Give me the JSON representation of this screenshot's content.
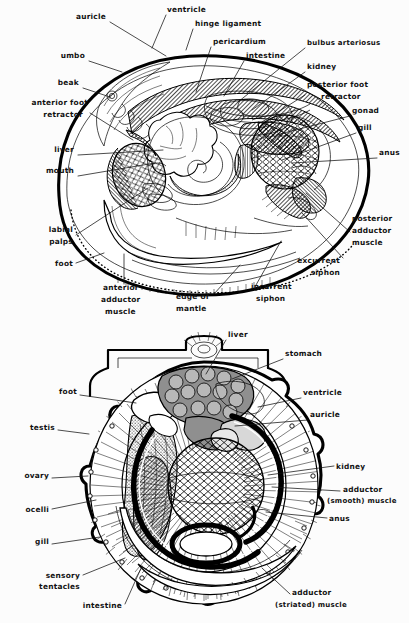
{
  "page": {
    "background": "#fcfcfc",
    "ink": "#111111",
    "width": 409,
    "height": 623
  },
  "figures": [
    {
      "id": "clam",
      "name": "freshwater-mussel-internal-anatomy",
      "labels": [
        {
          "text": "auricle",
          "x": 106,
          "y": 19,
          "anchor": "end",
          "leader": [
            [
              110,
              22
            ],
            [
              166,
              56
            ]
          ]
        },
        {
          "text": "ventricle",
          "x": 167,
          "y": 12,
          "anchor": "start",
          "leader": [
            [
              166,
              15
            ],
            [
              152,
              48
            ]
          ]
        },
        {
          "text": "hinge ligament",
          "x": 195,
          "y": 26,
          "anchor": "start",
          "leader": [
            [
              193,
              29
            ],
            [
              186,
              50
            ]
          ]
        },
        {
          "text": "pericardium",
          "x": 213,
          "y": 44,
          "anchor": "start",
          "leader": [
            [
              211,
              47
            ],
            [
              196,
              92
            ]
          ]
        },
        {
          "text": "intestine",
          "x": 246,
          "y": 58,
          "anchor": "start",
          "leader": [
            [
              244,
              61
            ],
            [
              224,
              96
            ]
          ]
        },
        {
          "text": "bulbus arteriosus",
          "x": 307,
          "y": 45,
          "anchor": "start",
          "leader": [
            [
              305,
              48
            ],
            [
              238,
              102
            ]
          ]
        },
        {
          "text": "kidney",
          "x": 307,
          "y": 69,
          "anchor": "start",
          "leader": [
            [
              305,
              72
            ],
            [
              252,
              110
            ]
          ]
        },
        {
          "text": "posterior foot",
          "x": 307,
          "y": 87,
          "anchor": "start",
          "leader": [
            [
              305,
              95
            ],
            [
              262,
              122
            ]
          ]
        },
        {
          "text": "retractor",
          "x": 321,
          "y": 99,
          "anchor": "start",
          "leader": null
        },
        {
          "text": "umbo",
          "x": 85,
          "y": 58,
          "anchor": "end",
          "leader": [
            [
              89,
              61
            ],
            [
              122,
              72
            ]
          ]
        },
        {
          "text": "beak",
          "x": 79,
          "y": 85,
          "anchor": "end",
          "leader": [
            [
              83,
              88
            ],
            [
              110,
              97
            ]
          ]
        },
        {
          "text": "anterior foot",
          "x": 88,
          "y": 105,
          "anchor": "end",
          "leader": [
            [
              90,
              113
            ],
            [
              133,
              140
            ]
          ]
        },
        {
          "text": "retractor",
          "x": 83,
          "y": 117,
          "anchor": "end",
          "leader": null
        },
        {
          "text": "gonad",
          "x": 352,
          "y": 113,
          "anchor": "start",
          "leader": [
            [
              350,
              116
            ],
            [
              276,
              135
            ]
          ]
        },
        {
          "text": "gill",
          "x": 358,
          "y": 130,
          "anchor": "start",
          "leader": [
            [
              356,
              133
            ],
            [
              282,
              160
            ]
          ]
        },
        {
          "text": "anus",
          "x": 379,
          "y": 155,
          "anchor": "start",
          "leader": [
            [
              377,
              158
            ],
            [
              292,
              163
            ]
          ]
        },
        {
          "text": "liver",
          "x": 74,
          "y": 152,
          "anchor": "end",
          "leader": [
            [
              78,
              155
            ],
            [
              163,
              150
            ]
          ]
        },
        {
          "text": "mouth",
          "x": 74,
          "y": 173,
          "anchor": "end",
          "leader": [
            [
              78,
              176
            ],
            [
              155,
              163
            ]
          ]
        },
        {
          "text": "labial",
          "x": 73,
          "y": 232,
          "anchor": "end",
          "leader": [
            [
              76,
              235
            ],
            [
              148,
              188
            ]
          ]
        },
        {
          "text": "palps",
          "x": 73,
          "y": 244,
          "anchor": "end",
          "leader": null
        },
        {
          "text": "foot",
          "x": 73,
          "y": 266,
          "anchor": "end",
          "leader": [
            [
              76,
              263
            ],
            [
              104,
              253
            ]
          ]
        },
        {
          "text": "posterior",
          "x": 352,
          "y": 221,
          "anchor": "start",
          "leader": [
            [
              350,
              232
            ],
            [
              306,
              193
            ]
          ]
        },
        {
          "text": "adductor",
          "x": 352,
          "y": 233,
          "anchor": "start",
          "leader": null
        },
        {
          "text": "muscle",
          "x": 352,
          "y": 245,
          "anchor": "start",
          "leader": null
        },
        {
          "text": "excurrent",
          "x": 340,
          "y": 263,
          "anchor": "end",
          "leader": [
            [
              343,
              258
            ],
            [
              302,
              213
            ]
          ]
        },
        {
          "text": "siphon",
          "x": 340,
          "y": 275,
          "anchor": "end",
          "leader": null
        },
        {
          "text": "incurrent",
          "x": 251,
          "y": 289,
          "anchor": "start",
          "leader": [
            [
              256,
              285
            ],
            [
              281,
              241
            ]
          ]
        },
        {
          "text": "siphon",
          "x": 256,
          "y": 301,
          "anchor": "start",
          "leader": null
        },
        {
          "text": "edge of",
          "x": 176,
          "y": 299,
          "anchor": "start",
          "leader": [
            [
              214,
              294
            ],
            [
              240,
              265
            ]
          ]
        },
        {
          "text": "mantle",
          "x": 176,
          "y": 311,
          "anchor": "start",
          "leader": null
        },
        {
          "text": "anterior",
          "x": 103,
          "y": 290,
          "anchor": "start",
          "leader": [
            [
              124,
              284
            ],
            [
              124,
              254
            ]
          ]
        },
        {
          "text": "adductor",
          "x": 101,
          "y": 302,
          "anchor": "start",
          "leader": null
        },
        {
          "text": "muscle",
          "x": 105,
          "y": 314,
          "anchor": "start",
          "leader": null
        }
      ]
    },
    {
      "id": "scallop",
      "name": "scallop-internal-anatomy",
      "labels": [
        {
          "text": "liver",
          "x": 228,
          "y": 17,
          "anchor": "start",
          "leader": [
            [
              226,
              20
            ],
            [
              206,
              54
            ]
          ]
        },
        {
          "text": "stomach",
          "x": 285,
          "y": 36,
          "anchor": "start",
          "leader": [
            [
              283,
              39
            ],
            [
              232,
              59
            ]
          ]
        },
        {
          "text": "ventricle",
          "x": 303,
          "y": 75,
          "anchor": "start",
          "leader": [
            [
              301,
              78
            ],
            [
              258,
              87
            ]
          ]
        },
        {
          "text": "auricle",
          "x": 310,
          "y": 97,
          "anchor": "start",
          "leader": [
            [
              308,
              100
            ],
            [
              235,
              106
            ]
          ]
        },
        {
          "text": "kidney",
          "x": 336,
          "y": 149,
          "anchor": "start",
          "leader": [
            [
              334,
              146
            ],
            [
              268,
              155
            ]
          ]
        },
        {
          "text": "adductor",
          "x": 343,
          "y": 172,
          "anchor": "start",
          "leader": [
            [
              340,
              171
            ],
            [
              272,
              167
            ]
          ]
        },
        {
          "text": "(smooth) muscle",
          "x": 327,
          "y": 183,
          "anchor": "start",
          "leader": null
        },
        {
          "text": "anus",
          "x": 329,
          "y": 201,
          "anchor": "start",
          "leader": [
            [
              327,
              198
            ],
            [
              266,
              192
            ]
          ]
        },
        {
          "text": "foot",
          "x": 77,
          "y": 74,
          "anchor": "end",
          "leader": [
            [
              80,
              75
            ],
            [
              136,
              83
            ]
          ]
        },
        {
          "text": "testis",
          "x": 55,
          "y": 110,
          "anchor": "end",
          "leader": [
            [
              58,
              110
            ],
            [
              89,
              114
            ]
          ]
        },
        {
          "text": "ovary",
          "x": 49,
          "y": 158,
          "anchor": "end",
          "leader": [
            [
              52,
              158
            ],
            [
              88,
              156
            ]
          ]
        },
        {
          "text": "ocelli",
          "x": 49,
          "y": 192,
          "anchor": "end",
          "leader": [
            [
              52,
              189
            ],
            [
              96,
              180
            ]
          ]
        },
        {
          "text": "gill",
          "x": 49,
          "y": 224,
          "anchor": "end",
          "leader": [
            [
              52,
              224
            ],
            [
              100,
              217
            ]
          ]
        },
        {
          "text": "sensory",
          "x": 80,
          "y": 258,
          "anchor": "end",
          "leader": [
            [
              83,
              255
            ],
            [
              125,
              238
            ]
          ]
        },
        {
          "text": "tentacles",
          "x": 80,
          "y": 269,
          "anchor": "end",
          "leader": null
        },
        {
          "text": "intestine",
          "x": 122,
          "y": 288,
          "anchor": "end",
          "leader": [
            [
              125,
              284
            ],
            [
              142,
              246
            ]
          ]
        },
        {
          "text": "adductor",
          "x": 292,
          "y": 275,
          "anchor": "start",
          "leader": [
            [
              290,
              274
            ],
            [
              262,
              248
            ]
          ]
        },
        {
          "text": "(striated) muscle",
          "x": 275,
          "y": 287,
          "anchor": "start",
          "leader": null
        }
      ]
    }
  ]
}
